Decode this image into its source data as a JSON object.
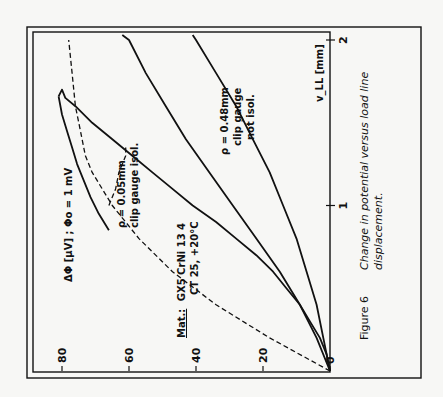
{
  "figure": {
    "label": "Figure 6",
    "caption_line1": "Change in potential versus load line",
    "caption_line2": "displacement."
  },
  "chart_data": {
    "type": "line",
    "orientation": "rotated 90° counter-clockwise on page",
    "xlabel": "v_LL [mm]",
    "ylabel": "ΔΦ [µV] ; Φo = 1 mV",
    "xlim": [
      0,
      2
    ],
    "ylim": [
      0,
      85
    ],
    "x_ticks": [
      0,
      1,
      2
    ],
    "y_ticks": [
      0,
      20,
      40,
      60,
      80
    ],
    "grid": false,
    "legend": "none (inline annotations)",
    "material_note_prefix": "Mat.:",
    "material_note_line1": "GX5 CrNi 13 4",
    "material_note_line2": "CT 25, +20°C",
    "series": [
      {
        "name": "ρ = 0.05 mm, clip gauge isol.",
        "style": "solid",
        "label_line1": "ρ = 0.05mm",
        "label_line2": "clip gauge isol.",
        "x": [
          0,
          0.1,
          0.2,
          0.3,
          0.4,
          0.5,
          0.6,
          0.7,
          0.8,
          0.9,
          1.0,
          1.1,
          1.2,
          1.3,
          1.4,
          1.5,
          1.6,
          1.65,
          1.7,
          1.66
        ],
        "values": [
          0,
          1,
          3,
          6,
          9,
          13,
          17,
          22,
          28,
          34,
          41,
          47,
          53,
          59,
          65,
          71,
          76,
          79,
          80,
          81
        ]
      },
      {
        "name": "ρ = 0.05 mm, clip gauge isol. (return/unloading)",
        "style": "solid",
        "x": [
          1.66,
          1.55,
          1.45,
          1.35,
          1.25,
          1.15,
          1.05,
          0.95,
          0.85
        ],
        "values": [
          81,
          80,
          78.5,
          77,
          75.5,
          73.5,
          71.5,
          69,
          66
        ]
      },
      {
        "name": "ρ = 0.48 mm, clip gauge not isol.",
        "style": "solid",
        "label_line1": "ρ = 0.48mm",
        "label_line2": "clip gauge",
        "label_line3": "not isol.",
        "x": [
          0,
          0.2,
          0.4,
          0.6,
          0.8,
          1.0,
          1.2,
          1.4,
          1.6,
          1.8,
          2.0,
          2.03
        ],
        "values": [
          0,
          2,
          4,
          7,
          10,
          14,
          18,
          23,
          28,
          34,
          40,
          41
        ]
      },
      {
        "name": "ρ = 0.48 mm (upper branch)",
        "style": "solid",
        "x": [
          0,
          0.2,
          0.4,
          0.6,
          0.8,
          1.0,
          1.2,
          1.4,
          1.6,
          1.8,
          2.0,
          2.03
        ],
        "values": [
          0,
          4,
          9,
          15,
          22,
          29,
          36,
          43,
          49,
          55,
          60,
          62
        ]
      },
      {
        "name": "Dashed reference (theoretical)",
        "style": "dashed",
        "x": [
          0,
          0.2,
          0.4,
          0.6,
          0.8,
          1.0,
          1.1,
          1.2,
          1.3,
          1.4,
          1.5,
          1.6,
          1.8,
          2.0
        ],
        "values": [
          0,
          18,
          34,
          47,
          57,
          65,
          68,
          71,
          73,
          74,
          75,
          76,
          77,
          78
        ]
      },
      {
        "name": "Dashed branch (isolated gauge)",
        "style": "dashed",
        "x": [
          1.0,
          1.1,
          1.2,
          1.3,
          1.35
        ],
        "values": [
          66,
          64,
          63,
          61,
          61
        ]
      }
    ]
  }
}
